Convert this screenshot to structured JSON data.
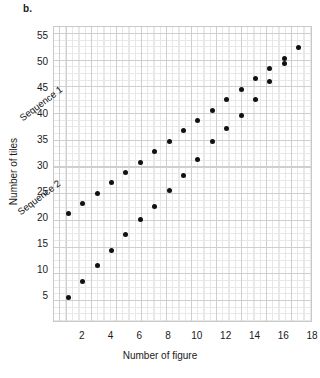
{
  "panel": {
    "label": "b."
  },
  "chart_data": {
    "type": "scatter",
    "title": "",
    "xlabel": "Number of figure",
    "ylabel": "Number of tiles",
    "xlim": [
      0,
      18
    ],
    "ylim": [
      0,
      57
    ],
    "xticks": [
      2,
      4,
      6,
      8,
      10,
      12,
      14,
      16,
      18
    ],
    "yticks": [
      5,
      10,
      15,
      20,
      25,
      30,
      35,
      40,
      45,
      50,
      55
    ],
    "grid": true,
    "legend": "inline-annotations",
    "marker": {
      "shape": "circle",
      "color": "#111111",
      "size": 5
    },
    "series": [
      {
        "name": "Sequence 1",
        "annotation": "Sequence 1",
        "x": [
          1,
          2,
          3,
          4,
          5,
          6,
          7,
          8,
          9,
          10,
          11,
          12,
          13,
          14,
          15,
          16,
          17
        ],
        "y": [
          21,
          23,
          25,
          27,
          29,
          31,
          33,
          35,
          37,
          39,
          41,
          43,
          45,
          47,
          49,
          51,
          53
        ]
      },
      {
        "name": "Sequence 2",
        "annotation": "Sequence 2",
        "x": [
          1,
          2,
          3,
          4,
          5,
          6,
          7,
          8,
          9,
          10,
          11,
          12,
          13,
          14,
          15,
          16
        ],
        "y": [
          5,
          8,
          11,
          14,
          17,
          20,
          22.5,
          25.5,
          28.5,
          31.5,
          35,
          37.5,
          40,
          43,
          46.5,
          50
        ]
      }
    ]
  }
}
